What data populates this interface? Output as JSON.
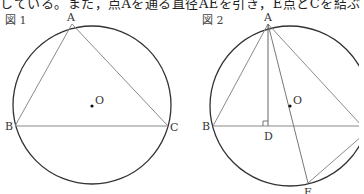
{
  "top_text": "している。また，点Aを通る直径AEを引き，E点とCを結ぶ",
  "figure1": {
    "title": "図 1",
    "labels": {
      "A": "A",
      "B": "B",
      "C": "C",
      "O": "O"
    },
    "circle": {
      "cx": 92,
      "cy": 105,
      "r": 79
    },
    "points": {
      "A": [
        72,
        24
      ],
      "B": [
        15,
        126
      ],
      "C": [
        168,
        126
      ],
      "O": [
        92,
        106
      ]
    }
  },
  "figure2": {
    "title": "図 2",
    "labels": {
      "A": "A",
      "B": "B",
      "D": "D",
      "O": "O",
      "E": "E"
    },
    "circle": {
      "cx": 290,
      "cy": 106,
      "r": 80
    },
    "points": {
      "A": [
        268,
        24
      ],
      "B": [
        213,
        126
      ],
      "C": [
        362,
        126
      ],
      "D": [
        268,
        126
      ],
      "O": [
        290,
        106
      ],
      "E": [
        308,
        183
      ]
    }
  },
  "colors": {
    "circle": "#333333",
    "line": "#888888"
  }
}
